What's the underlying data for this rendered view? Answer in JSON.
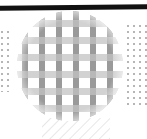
{
  "figure": {
    "title": "Woven mesh disc schematic",
    "canvas": {
      "width": 147,
      "height": 139,
      "background": "#ffffff"
    },
    "top_bar": {
      "name": "top-dark-bar",
      "label": "Top edge bar",
      "color": "#111111",
      "x": 0,
      "y": 5,
      "width": 147,
      "height": 5,
      "tilt_degrees": -0.6
    },
    "disc": {
      "name": "mesh-disc",
      "label": "Mesh disc",
      "center_x": 70,
      "center_y": 66,
      "radius_x": 53,
      "radius_y": 55,
      "fill": "#ffffff"
    },
    "mesh": {
      "label": "Woven grid mesh",
      "horizontal_band": {
        "color": "#d2d2d2",
        "thickness": 7,
        "pitch": 17,
        "offset": 3,
        "count": 7
      },
      "vertical_band": {
        "color": "#9a9a9a",
        "thickness": 6,
        "pitch": 17,
        "offset": 5,
        "count": 7
      },
      "intersection_color": "#b8b8b8"
    },
    "dot_fields": [
      {
        "name": "left-dot-field",
        "label": "Left dot field",
        "color": "#b6b6b6",
        "dot_size": 2,
        "pitch_x": 6,
        "pitch_y": 6,
        "x": 1,
        "y": 30,
        "width": 12,
        "height": 62
      },
      {
        "name": "right-dot-field",
        "label": "Right dot field",
        "color": "#b6b6b6",
        "dot_size": 2,
        "pitch_x": 6,
        "pitch_y": 6,
        "x": 127,
        "y": 24,
        "width": 20,
        "height": 82
      }
    ],
    "hatch": {
      "name": "bottom-hatch",
      "label": "Bottom diagonal hatch",
      "color": "#d6d6d6",
      "line_width": 1.2,
      "spacing": 7,
      "angle_degrees": 45,
      "x": 42,
      "y": 118,
      "width": 68,
      "height": 21
    }
  }
}
